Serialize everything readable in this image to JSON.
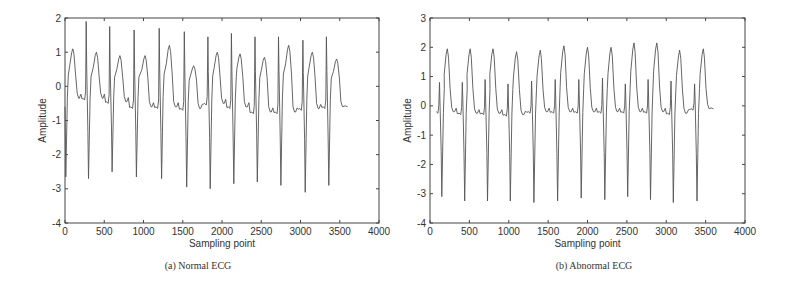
{
  "chart_data": [
    {
      "type": "line",
      "title": "",
      "caption": "(a) Normal ECG",
      "xlabel": "Sampling point",
      "ylabel": "Amplitude",
      "xlim": [
        0,
        4000
      ],
      "ylim": [
        -4,
        2
      ],
      "xticks": [
        0,
        500,
        1000,
        1500,
        2000,
        2500,
        3000,
        3500,
        4000
      ],
      "yticks": [
        -4,
        -3,
        -2,
        -1,
        0,
        1,
        2
      ],
      "grid": false,
      "line_color": "#555555",
      "series": [
        {
          "name": "Normal ECG",
          "beats": {
            "r_peak_x": [
              270,
              570,
              880,
              1200,
              1520,
              1820,
              2120,
              2420,
              2720,
              3030,
              3330
            ],
            "r_peak_y": [
              1.9,
              1.75,
              1.65,
              1.7,
              1.6,
              1.45,
              1.55,
              1.45,
              1.45,
              1.35,
              1.45
            ],
            "s_trough_x": [
              10,
              300,
              600,
              910,
              1230,
              1550,
              1850,
              2150,
              2450,
              2750,
              3060,
              3360
            ],
            "s_trough_y": [
              -2.65,
              -2.7,
              -2.5,
              -2.65,
              -2.7,
              -2.95,
              -3.0,
              -2.85,
              -2.8,
              -2.9,
              -3.1,
              -2.9
            ],
            "t_peak_x": [
              100,
              400,
              700,
              1020,
              1330,
              1640,
              1940,
              2230,
              2540,
              2850,
              3150,
              3460
            ],
            "t_peak_y": [
              1.1,
              1.0,
              0.9,
              0.9,
              1.2,
              0.6,
              1.0,
              0.95,
              0.85,
              1.2,
              1.0,
              0.8
            ],
            "baseline_y": [
              -0.35,
              -0.35,
              -0.45,
              -0.6,
              -0.6,
              -0.65,
              -0.5,
              -0.6,
              -0.75,
              -0.75,
              -0.65,
              -0.6
            ]
          },
          "x_end": 3600,
          "y_end": -0.6
        }
      ]
    },
    {
      "type": "line",
      "title": "",
      "caption": "(b) Abnormal ECG",
      "xlabel": "Sampling point",
      "ylabel": "Amplitude",
      "xlim": [
        0,
        4000
      ],
      "ylim": [
        -4,
        3
      ],
      "xticks": [
        0,
        500,
        1000,
        1500,
        2000,
        2500,
        3000,
        3500,
        4000
      ],
      "yticks": [
        -4,
        -3,
        -2,
        -1,
        0,
        1,
        2,
        3
      ],
      "grid": false,
      "line_color": "#555555",
      "series": [
        {
          "name": "Abnormal ECG",
          "beats": {
            "r_peak_x": [
              120,
              410,
              700,
              990,
              1290,
              1590,
              1890,
              2190,
              2480,
              2770,
              3060,
              3360
            ],
            "r_peak_y": [
              0.8,
              0.8,
              0.9,
              0.75,
              0.85,
              0.9,
              0.9,
              0.95,
              0.75,
              0.9,
              0.85,
              0.75
            ],
            "s_trough_x": [
              150,
              440,
              730,
              1020,
              1320,
              1620,
              1920,
              2220,
              2510,
              2800,
              3090,
              3390
            ],
            "s_trough_y": [
              -3.1,
              -3.25,
              -3.25,
              -3.25,
              -3.3,
              -3.25,
              -3.15,
              -3.2,
              -3.1,
              -3.2,
              -3.3,
              -3.25
            ],
            "t_peak_x": [
              220,
              510,
              800,
              1100,
              1400,
              1700,
              2000,
              2300,
              2590,
              2880,
              3170,
              3470
            ],
            "t_peak_y": [
              1.95,
              1.95,
              1.95,
              1.85,
              1.9,
              2.05,
              2.0,
              2.0,
              2.15,
              2.15,
              1.9,
              1.95
            ],
            "baseline_y": [
              -0.2,
              -0.25,
              -0.25,
              -0.3,
              -0.2,
              -0.2,
              -0.2,
              -0.2,
              -0.2,
              -0.2,
              -0.25,
              -0.1
            ]
          },
          "x_end": 3600,
          "y_end": -0.1
        }
      ]
    }
  ]
}
